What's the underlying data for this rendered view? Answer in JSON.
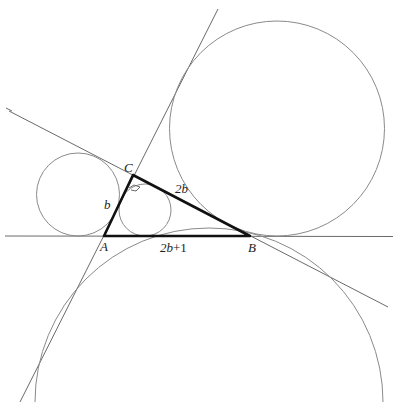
{
  "diagram": {
    "vertices": {
      "A": "A",
      "B": "B",
      "C": "C"
    },
    "sides": {
      "AC": "b",
      "CB": "2b",
      "AB_coef": "2b",
      "AB_plus": "+1"
    },
    "right_angle_at": "C",
    "colors": {
      "triangle": "#111111",
      "lines": "#6a6a6a",
      "circles": "#8a8a8a"
    }
  }
}
